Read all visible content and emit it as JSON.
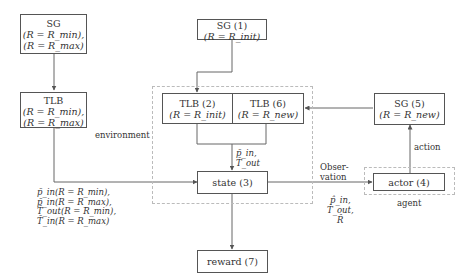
{
  "diagram": {
    "nodes": {
      "sg_left": {
        "title": "SG",
        "line1": "(R = R_min),",
        "line2": "(R = R_max)"
      },
      "tlb_left": {
        "title": "TLB",
        "line1": "(R = R_min),",
        "line2": "(R = R_max)"
      },
      "sg1": {
        "title": "SG (1)",
        "line1": "(R = R_init)"
      },
      "tlb2": {
        "title": "TLB (2)",
        "line1": "(R = R_init)"
      },
      "tlb6": {
        "title": "TLB (6)",
        "line1": "(R = R_new)"
      },
      "sg5": {
        "title": "SG (5)",
        "line1": "(R = R_new)"
      },
      "state3": {
        "title": "state (3)"
      },
      "actor4": {
        "title": "actor (4)"
      },
      "reward7": {
        "title": "reward (7)"
      }
    },
    "groups": {
      "environment": "environment",
      "agent": "agent"
    },
    "edge_labels": {
      "tlb_to_state": [
        "p̄_in,",
        "T̄_out"
      ],
      "left_inputs": [
        "p̄_in(R = R_min),",
        "p̄_in(R = R_max),",
        "T̄_out(R = R_min),",
        "T̄_in(R = R_max)"
      ],
      "observation": [
        "Obser-",
        "vation"
      ],
      "observation_vars": [
        "p̂_in,",
        "T̂_out,",
        "R̂"
      ],
      "action": "action"
    }
  }
}
